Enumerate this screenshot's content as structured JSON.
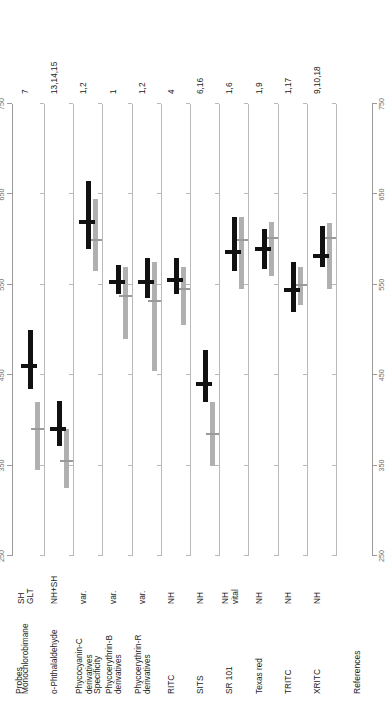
{
  "figure": {
    "columns": {
      "probes": "Probes",
      "specificity": "Specificity",
      "references": "References"
    }
  },
  "colors": {
    "excitation": "#111111",
    "emission": "#b0b0b0",
    "axis": "#9a9a9a",
    "gridline": "#b9b9b9",
    "text": "#1a1a1a",
    "tick_label": "#6d6d6d"
  },
  "chart_data": {
    "type": "bar",
    "title": "",
    "xlabel": "",
    "ylabel": "",
    "orientation": "horizontal-ranges",
    "xlim": [
      250,
      750
    ],
    "ticks": [
      250,
      350,
      450,
      550,
      650,
      750
    ],
    "tick_labels": [
      "250",
      "350",
      "450",
      "550",
      "650",
      "750"
    ],
    "grid": true,
    "legend": [
      {
        "name": "Excitation",
        "color": "#111111"
      },
      {
        "name": "Emission",
        "color": "#b0b0b0"
      }
    ],
    "categories": [
      "Monochlorobimane",
      "o-Phthalaldehyde",
      "Phycocyanin-C derivatives",
      "Phycoerythrin-B derivatives",
      "Phycoerythrin-R derivatives",
      "RITC",
      "SITS",
      "SR 101",
      "Texas red",
      "TRITC",
      "XRITC"
    ],
    "series": [
      {
        "name": "Excitation",
        "color": "#111111",
        "ranges": [
          [
            435,
            500
          ],
          [
            372,
            422
          ],
          [
            590,
            665
          ],
          [
            540,
            572
          ],
          [
            535,
            580
          ],
          [
            540,
            580
          ],
          [
            420,
            478
          ],
          [
            565,
            625
          ],
          [
            568,
            612
          ],
          [
            520,
            575
          ],
          [
            570,
            615
          ]
        ],
        "peaks": [
          460,
          390,
          620,
          553,
          553,
          555,
          440,
          586,
          590,
          544,
          582
        ]
      },
      {
        "name": "Emission",
        "color": "#b0b0b0",
        "ranges": [
          [
            345,
            420
          ],
          [
            325,
            390
          ],
          [
            565,
            645
          ],
          [
            490,
            570
          ],
          [
            455,
            575
          ],
          [
            505,
            570
          ],
          [
            350,
            420
          ],
          [
            545,
            625
          ],
          [
            560,
            620
          ],
          [
            528,
            570
          ],
          [
            545,
            618
          ]
        ],
        "peaks": [
          390,
          355,
          600,
          538,
          532,
          545,
          385,
          600,
          602,
          550,
          602
        ]
      }
    ]
  },
  "rows": [
    {
      "probe": "Monochlorobimane",
      "specificity": "SH\nGLT",
      "references": "7"
    },
    {
      "probe": "o-Phthalaldehyde",
      "specificity": "NH+SH",
      "references": "13,14,15"
    },
    {
      "probe": "Phycocyanin-C\nderivatives",
      "specificity": "var.",
      "references": "1,2"
    },
    {
      "probe": "Phycoerythrin-B\nderivatives",
      "specificity": "var.",
      "references": "1"
    },
    {
      "probe": "Phycoerythrin-R\nderivatives",
      "specificity": "var.",
      "references": "1,2"
    },
    {
      "probe": "RITC",
      "specificity": "NH",
      "references": "4"
    },
    {
      "probe": "SITS",
      "specificity": "NH",
      "references": "6,16"
    },
    {
      "probe": "SR 101",
      "specificity": "NH\nvital",
      "references": "1,6"
    },
    {
      "probe": "Texas red",
      "specificity": "NH",
      "references": "1,9"
    },
    {
      "probe": "TRITC",
      "specificity": "NH",
      "references": "1,17"
    },
    {
      "probe": "XRITC",
      "specificity": "NH",
      "references": "9,10,18"
    }
  ]
}
